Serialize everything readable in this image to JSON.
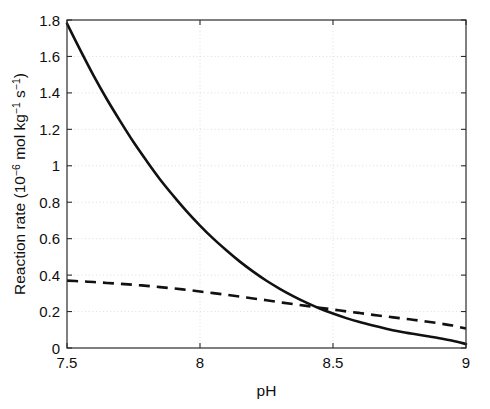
{
  "chart_data": {
    "type": "line",
    "title": "",
    "xlabel": "pH",
    "ylabel": "Reaction rate (10⁻⁶ mol kg⁻¹ s⁻¹)",
    "ylabel_parts": {
      "prefix": "Reaction rate (10",
      "exp1": "−6",
      "mid": " mol kg",
      "exp2": "−1",
      "mid2": " s",
      "exp3": "−1",
      "suffix": ")"
    },
    "xlim": [
      7.5,
      9.0
    ],
    "ylim": [
      0,
      1.8
    ],
    "grid": true,
    "grid_style": "dotted",
    "legend": "none",
    "xticks": [
      7.5,
      8,
      8.5,
      9
    ],
    "xticklabels": [
      "7.5",
      "8",
      "8.5",
      "9"
    ],
    "yticks": [
      0,
      0.2,
      0.4,
      0.6,
      0.8,
      1.0,
      1.2,
      1.4,
      1.6,
      1.8
    ],
    "yticklabels": [
      "0",
      "0.2",
      "0.4",
      "0.6",
      "0.8",
      "1",
      "1.2",
      "1.4",
      "1.6",
      "1.8"
    ],
    "x": [
      7.5,
      7.55,
      7.6,
      7.65,
      7.7,
      7.75,
      7.8,
      7.85,
      7.9,
      7.95,
      8.0,
      8.05,
      8.1,
      8.15,
      8.2,
      8.25,
      8.3,
      8.35,
      8.4,
      8.45,
      8.5,
      8.55,
      8.6,
      8.65,
      8.7,
      8.75,
      8.8,
      8.85,
      8.9,
      8.95,
      9.0
    ],
    "series": [
      {
        "name": "solid-curve",
        "style": "solid",
        "color": "#111111",
        "values": [
          1.78,
          1.635,
          1.495,
          1.365,
          1.245,
          1.13,
          1.025,
          0.925,
          0.835,
          0.75,
          0.672,
          0.6,
          0.535,
          0.474,
          0.419,
          0.369,
          0.325,
          0.285,
          0.249,
          0.217,
          0.189,
          0.164,
          0.142,
          0.123,
          0.106,
          0.091,
          0.078,
          0.066,
          0.054,
          0.04,
          0.022
        ]
      },
      {
        "name": "dashed-curve",
        "style": "dashed",
        "color": "#111111",
        "values": [
          0.37,
          0.366,
          0.362,
          0.357,
          0.352,
          0.347,
          0.341,
          0.334,
          0.327,
          0.319,
          0.31,
          0.301,
          0.292,
          0.282,
          0.272,
          0.262,
          0.251,
          0.241,
          0.231,
          0.221,
          0.211,
          0.201,
          0.192,
          0.182,
          0.173,
          0.164,
          0.155,
          0.145,
          0.135,
          0.123,
          0.107
        ]
      }
    ],
    "annotations": {
      "crossing_point": {
        "x": 8.19,
        "y": 0.253
      }
    }
  },
  "plot_box": {
    "left": 67,
    "right": 466,
    "top": 20,
    "bottom": 348
  }
}
